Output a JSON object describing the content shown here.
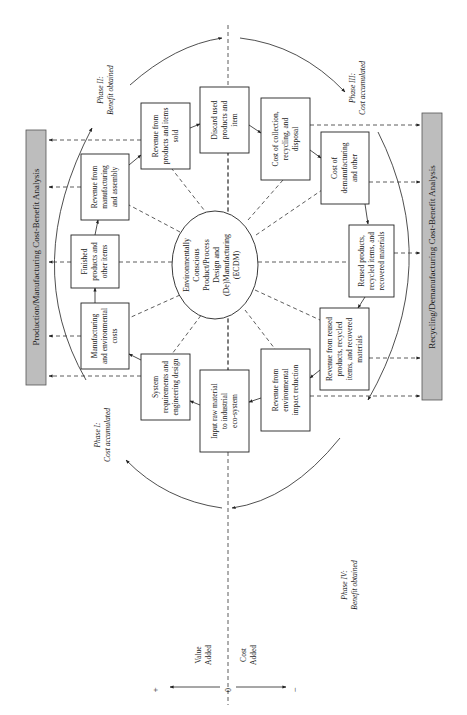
{
  "diagram": {
    "center": {
      "lines": [
        "Environmentally",
        "Conscious",
        "Product/Process",
        "Design and",
        "(De)Manufacturing",
        "(ECDM)"
      ]
    },
    "side_bars": {
      "left": "Production/Manufacturing Cost-Benefit Analysis",
      "right": "Recycling/Demanufacturing Cost-Benefit Analysis"
    },
    "phases": [
      {
        "title": "Phase I:",
        "subtitle": "Cost accumulated"
      },
      {
        "title": "Phase II:",
        "subtitle": "Benefit obtained"
      },
      {
        "title": "Phase III:",
        "subtitle": "Cost accumulated"
      },
      {
        "title": "Phase IV:",
        "subtitle": "Benefit obtained"
      }
    ],
    "boxes": [
      {
        "id": "revenue-products-sold",
        "lines": [
          "Revenue from",
          "products and items",
          "sold"
        ]
      },
      {
        "id": "discard-used-products",
        "lines": [
          "Discard used",
          "products and",
          "item"
        ]
      },
      {
        "id": "cost-collection-recycling",
        "lines": [
          "Cost of collection,",
          "recycling, and",
          "disposal"
        ]
      },
      {
        "id": "cost-demanufacturing",
        "lines": [
          "Cost of",
          "demanufacturing",
          "and other"
        ]
      },
      {
        "id": "reused-products",
        "lines": [
          "Reused products,",
          "recycled items, and",
          "recovered materials"
        ]
      },
      {
        "id": "revenue-reused-products",
        "lines": [
          "Revenue from reused",
          "products, recycled",
          "items, and recovered",
          "materials"
        ]
      },
      {
        "id": "revenue-environmental",
        "lines": [
          "Revenue from",
          "environmental",
          "impact reduction"
        ]
      },
      {
        "id": "input-raw-material",
        "lines": [
          "Input raw material",
          "to industrial",
          "eco-system"
        ]
      },
      {
        "id": "system-requirements",
        "lines": [
          "System",
          "requirements and",
          "engineering design"
        ]
      },
      {
        "id": "manufacturing-costs",
        "lines": [
          "Manufacturing",
          "and environmental",
          "costs"
        ]
      },
      {
        "id": "finished-products",
        "lines": [
          "Finished",
          "products and",
          "other items"
        ]
      },
      {
        "id": "revenue-manufacturing",
        "lines": [
          "Revenue from",
          "manufacturing",
          "and assembly"
        ]
      }
    ],
    "axis": {
      "plus": "+",
      "minus": "−",
      "zero": "0",
      "value_added": [
        "Value",
        "Added"
      ],
      "cost_added": [
        "Cost",
        "Added"
      ]
    },
    "colors": {
      "bar_fill": "#bdbdbd",
      "line": "#222222"
    }
  }
}
